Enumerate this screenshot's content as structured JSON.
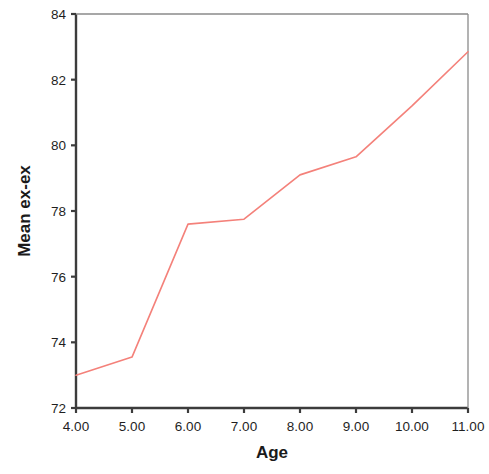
{
  "chart_data": {
    "type": "line",
    "title": "",
    "xlabel": "Age",
    "ylabel": "Mean ex-ex",
    "xlim": [
      4,
      11
    ],
    "ylim": [
      72,
      84
    ],
    "grid": false,
    "legend": null,
    "line_color": "#f4817a",
    "axis_color": "#3c3c3c",
    "x": [
      4,
      5,
      6,
      7,
      8,
      9,
      10,
      11
    ],
    "values": [
      73.0,
      73.55,
      77.6,
      77.75,
      79.1,
      79.65,
      81.2,
      82.85
    ],
    "series": [
      {
        "name": "Mean ex-ex",
        "values": [
          73.0,
          73.55,
          77.6,
          77.75,
          79.1,
          79.65,
          81.2,
          82.85
        ]
      }
    ],
    "xtick_labels": [
      "4.00",
      "5.00",
      "6.00",
      "7.00",
      "8.00",
      "9.00",
      "10.00",
      "11.00"
    ],
    "xtick_values": [
      4,
      5,
      6,
      7,
      8,
      9,
      10,
      11
    ],
    "ytick_labels": [
      "72",
      "74",
      "76",
      "78",
      "80",
      "82",
      "84"
    ],
    "ytick_values": [
      72,
      74,
      76,
      78,
      80,
      82,
      84
    ]
  }
}
